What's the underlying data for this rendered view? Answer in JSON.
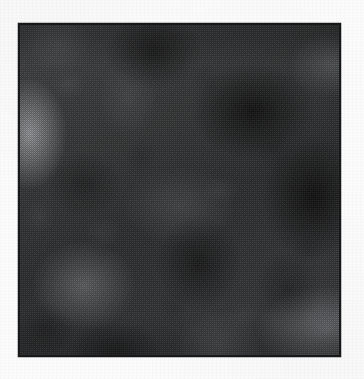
{
  "page": {
    "background_color": "#fbfbfb",
    "width": 364,
    "height": 379
  },
  "plate": {
    "name": "grayscale-texture-plate",
    "border_color": "#17181a",
    "border_width_px": 2,
    "left_px": 18,
    "top_px": 23,
    "width_px": 323,
    "height_px": 334,
    "base_color": "#2a2b2c",
    "caption": "",
    "label": "",
    "alt_text": "Dark mottled cloud-like grayscale noise texture with halftone dithering"
  },
  "texture": {
    "type": "halftone-dithered-grayscale-noise",
    "rendering": "checkerboard dither screen over smooth cloud blobs",
    "dither_cell_px": 2,
    "tone_range": {
      "darkest_hex": "#0d0e0f",
      "midtone_hex": "#3a3b3d",
      "lightest_hex": "#b9bbbf"
    },
    "light_regions": [
      {
        "name": "left-edge-highlight",
        "x_pct": 3,
        "y_pct": 33,
        "intensity": 0.62
      },
      {
        "name": "lower-left-highlight",
        "x_pct": 20,
        "y_pct": 79,
        "intensity": 0.42
      },
      {
        "name": "bottom-right-highlight",
        "x_pct": 96,
        "y_pct": 92,
        "intensity": 0.46
      },
      {
        "name": "top-right-highlight",
        "x_pct": 98,
        "y_pct": 12,
        "intensity": 0.34
      },
      {
        "name": "center-soft-highlight",
        "x_pct": 50,
        "y_pct": 55,
        "intensity": 0.26
      },
      {
        "name": "bottom-center-highlight",
        "x_pct": 62,
        "y_pct": 97,
        "intensity": 0.28
      }
    ],
    "dark_regions": [
      {
        "name": "upper-right-shadow",
        "x_pct": 73,
        "y_pct": 26,
        "intensity": 0.7
      },
      {
        "name": "right-middle-shadow",
        "x_pct": 92,
        "y_pct": 52,
        "intensity": 0.74
      },
      {
        "name": "top-center-shadow",
        "x_pct": 42,
        "y_pct": 8,
        "intensity": 0.55
      },
      {
        "name": "center-lower-shadow",
        "x_pct": 56,
        "y_pct": 72,
        "intensity": 0.5
      },
      {
        "name": "left-middle-shadow",
        "x_pct": 20,
        "y_pct": 48,
        "intensity": 0.34
      },
      {
        "name": "bottom-left-shadow",
        "x_pct": 30,
        "y_pct": 99,
        "intensity": 0.44
      }
    ]
  },
  "margins": {
    "has_visible_text": false,
    "grain": "faint scanner paper noise"
  }
}
